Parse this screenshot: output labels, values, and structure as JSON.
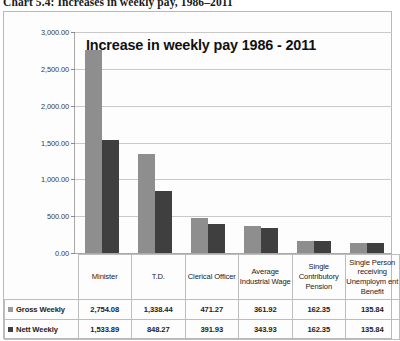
{
  "figure": {
    "caption": "Chart 5.4: Increases in weekly pay, 1986–2011"
  },
  "chart_data": {
    "type": "bar",
    "title": "Increase in weekly pay 1986 - 2011",
    "xlabel": "",
    "ylabel": "",
    "ylim": [
      0,
      3000
    ],
    "ytick_labels": [
      "3,000.00",
      "2,500.00",
      "2,000.00",
      "1,500.00",
      "1,000.00",
      "500.00",
      "0.00"
    ],
    "ytick_values": [
      3000,
      2500,
      2000,
      1500,
      1000,
      500,
      0
    ],
    "grid": true,
    "legend_position": "bottom-table",
    "categories": [
      "Minister",
      "T.D.",
      "Clerical Officer",
      "Average Industrial Wage",
      "Single Contributory Pension",
      "Single Person receiving Unemploym ent Benefit"
    ],
    "series": [
      {
        "name": "Gross Weekly",
        "color": "#8e8e8e",
        "values": [
          2754.08,
          1338.44,
          471.27,
          361.92,
          162.35,
          135.84
        ],
        "labels": [
          "2,754.08",
          "1,338.44",
          "471.27",
          "361.92",
          "162.35",
          "135.84"
        ]
      },
      {
        "name": "Nett Weekly",
        "color": "#3f3f3f",
        "values": [
          1533.89,
          848.27,
          391.93,
          343.93,
          162.35,
          135.84
        ],
        "labels": [
          "1,533.89",
          "848.27",
          "391.93",
          "343.93",
          "162.35",
          "135.84"
        ]
      }
    ]
  }
}
